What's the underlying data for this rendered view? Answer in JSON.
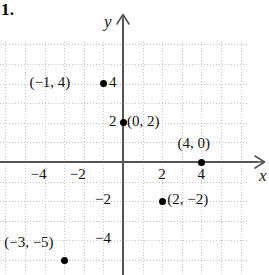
{
  "problem": {
    "number": "1."
  },
  "chart_data": {
    "type": "scatter",
    "title": "",
    "xlabel": "x",
    "ylabel": "y",
    "xlim": [
      -6,
      7
    ],
    "ylim": [
      -6,
      6
    ],
    "grid": true,
    "legend": "none",
    "x_ticks": [
      {
        "value": -4,
        "label": "−4"
      },
      {
        "value": -2,
        "label": "−2"
      },
      {
        "value": 2,
        "label": "2"
      },
      {
        "value": 4,
        "label": "4"
      }
    ],
    "y_ticks": [
      {
        "value": 4,
        "label": "4"
      },
      {
        "value": 2,
        "label": "2"
      },
      {
        "value": -2,
        "label": "−2"
      },
      {
        "value": -4,
        "label": "−4"
      }
    ],
    "points": [
      {
        "x": -1,
        "y": 4,
        "label": "(−1, 4)"
      },
      {
        "x": 0,
        "y": 2,
        "label": "(0, 2)"
      },
      {
        "x": 4,
        "y": 0,
        "label": "(4, 0)"
      },
      {
        "x": 2,
        "y": -2,
        "label": "(2, −2)"
      },
      {
        "x": -3,
        "y": -5,
        "label": "(−3, −5)"
      }
    ]
  },
  "axes": {
    "x_name": "x",
    "y_name": "y"
  },
  "colors": {
    "axis": "#555555",
    "grid": "#c4c4c4",
    "point": "#000000",
    "text": "#111111"
  }
}
